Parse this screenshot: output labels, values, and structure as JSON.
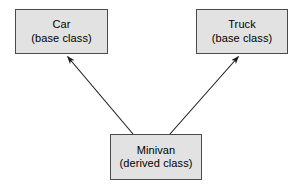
{
  "diagram": {
    "type": "class-inheritance",
    "background_color": "#ffffff",
    "node_fill_color": "#e2e2e2",
    "node_border_color": "#4a4a4a",
    "edge_color": "#1a1a1a",
    "nodes": [
      {
        "id": "car",
        "title": "Car",
        "subtitle": "(base class)",
        "role": "base class"
      },
      {
        "id": "truck",
        "title": "Truck",
        "subtitle": "(base class)",
        "role": "base class"
      },
      {
        "id": "minivan",
        "title": "Minivan",
        "subtitle": "(derived class)",
        "role": "derived class"
      }
    ],
    "edges": [
      {
        "id": "minivan-to-car",
        "from": "minivan",
        "to": "car",
        "arrowhead": "filled",
        "from_point": [
          133,
          134
        ],
        "to_point": [
          66,
          55
        ]
      },
      {
        "id": "minivan-to-truck",
        "from": "minivan",
        "to": "truck",
        "arrowhead": "filled",
        "from_point": [
          170,
          134
        ],
        "to_point": [
          240,
          55
        ]
      }
    ]
  }
}
